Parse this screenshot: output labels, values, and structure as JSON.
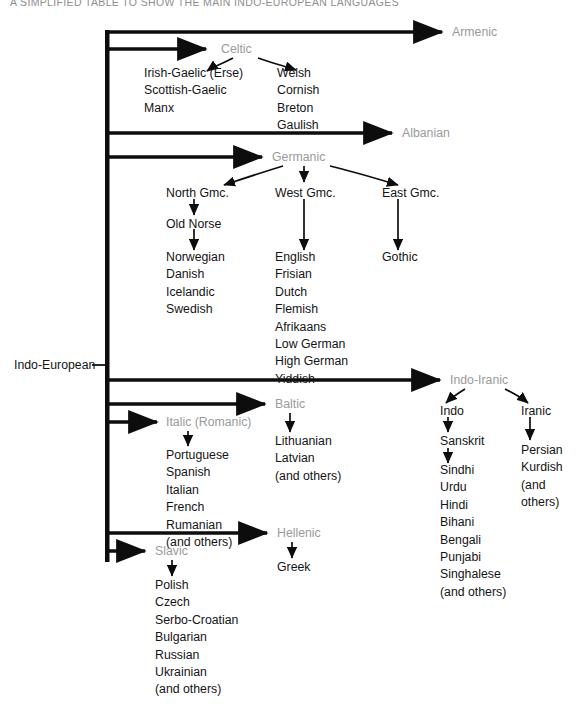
{
  "title": "A SIMPLIFIED TABLE TO SHOW THE MAIN INDO-EUROPEAN LANGUAGES",
  "root": {
    "label": "Indo-European"
  },
  "colors": {
    "branch_label": "#9a9a9a",
    "leaf_text": "#141414",
    "line": "#0d0d0d",
    "background": "#ffffff"
  },
  "branches": {
    "armenic": {
      "label": "Armenic"
    },
    "celtic": {
      "label": "Celtic",
      "left_group": [
        "Irish-Gaelic (Erse)",
        "Scottish-Gaelic",
        "Manx"
      ],
      "right_group": [
        "Welsh",
        "Cornish",
        "Breton",
        "Gaulish"
      ]
    },
    "albanian": {
      "label": "Albanian"
    },
    "germanic": {
      "label": "Germanic",
      "north": {
        "label": "North Gmc.",
        "intermediate": "Old Norse",
        "items": [
          "Norwegian",
          "Danish",
          "Icelandic",
          "Swedish"
        ]
      },
      "west": {
        "label": "West Gmc.",
        "items": [
          "English",
          "Frisian",
          "Dutch",
          "Flemish",
          "Afrikaans",
          "Low German",
          "High German",
          "Yiddish"
        ]
      },
      "east": {
        "label": "East Gmc.",
        "items": [
          "Gothic"
        ]
      }
    },
    "indo_iranic": {
      "label": "Indo-Iranic",
      "indo": {
        "label": "Indo",
        "intermediate": "Sanskrit",
        "items": [
          "Sindhi",
          "Urdu",
          "Hindi",
          "Bihani",
          "Bengali",
          "Punjabi",
          "Singhalese",
          "(and others)"
        ]
      },
      "iranic": {
        "label": "Iranic",
        "items": [
          "Persian",
          "Kurdish",
          "(and",
          "others)"
        ]
      }
    },
    "baltic": {
      "label": "Baltic",
      "items": [
        "Lithuanian",
        "Latvian",
        "(and others)"
      ]
    },
    "italic": {
      "label": "Italic (Romanic)",
      "items": [
        "Portuguese",
        "Spanish",
        "Italian",
        "French",
        "Rumanian",
        "(and others)"
      ]
    },
    "hellenic": {
      "label": "Hellenic",
      "items": [
        "Greek"
      ]
    },
    "slavic": {
      "label": "Slavic",
      "items": [
        "Polish",
        "Czech",
        "Serbo-Croatian",
        "Bulgarian",
        "Russian",
        "Ukrainian",
        "(and others)"
      ]
    }
  }
}
